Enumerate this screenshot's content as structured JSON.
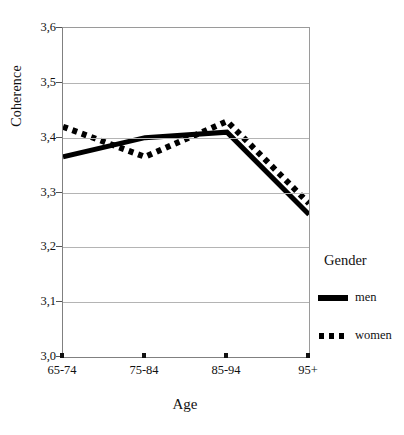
{
  "chart_data": {
    "type": "line",
    "title": "",
    "xlabel": "Age",
    "ylabel": "Coherence",
    "categories": [
      "65-74",
      "75-84",
      "85-94",
      "95+"
    ],
    "series": [
      {
        "name": "men",
        "style": "solid",
        "color": "#000000",
        "values": [
          3.365,
          3.4,
          3.41,
          3.26
        ]
      },
      {
        "name": "women",
        "style": "dotted",
        "color": "#000000",
        "values": [
          3.42,
          3.365,
          3.43,
          3.28
        ]
      }
    ],
    "ylim": [
      3.0,
      3.6
    ],
    "yticks": [
      "3,0",
      "3,1",
      "3,2",
      "3,3",
      "3,4",
      "3,5",
      "3,6"
    ],
    "ytick_values": [
      3.0,
      3.1,
      3.2,
      3.3,
      3.4,
      3.5,
      3.6
    ],
    "grid": true,
    "legend_position": "right",
    "legend_title": "Gender"
  }
}
